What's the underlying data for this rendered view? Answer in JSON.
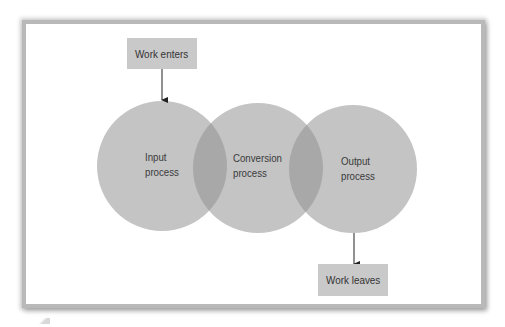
{
  "diagram": {
    "input_box": {
      "label": "Work enters"
    },
    "output_box": {
      "label": "Work leaves"
    },
    "circles": [
      {
        "line1": "Input",
        "line2": "process"
      },
      {
        "line1": "Conversion",
        "line2": "process"
      },
      {
        "line1": "Output",
        "line2": "process"
      }
    ],
    "colors": {
      "circle_fill": "#c4c4c4",
      "overlap_fill": "#a8a8a8",
      "box_fill": "#c9c9c9",
      "text": "#333333",
      "frame_border": "#b9b9b9"
    }
  }
}
